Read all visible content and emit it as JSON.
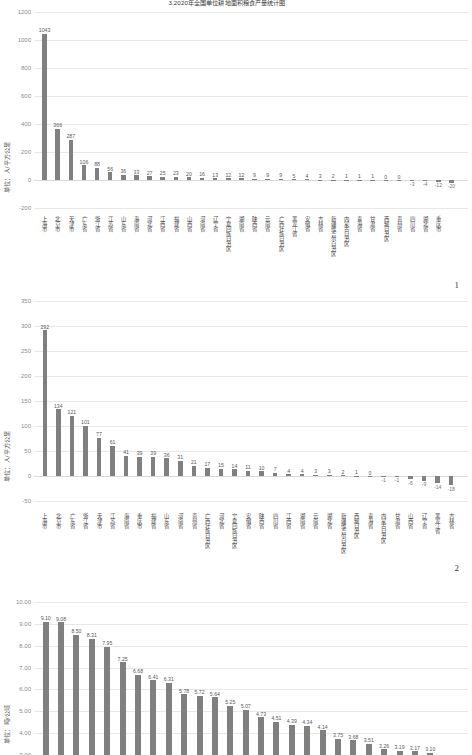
{
  "document": {
    "title": "3.2020年全国单位耕地面积粮食产量统计图"
  },
  "page_numbers": {
    "chart1": "1",
    "chart2": "2"
  },
  "charts": [
    {
      "id": "chart1",
      "ylabel": "单位：人/平方公里",
      "yticks": [
        "1200",
        "1000",
        "800",
        "600",
        "400",
        "200",
        "0",
        "-200"
      ],
      "ymin": -200,
      "ymax": 1200,
      "categories": [
        "上海市",
        "北京市",
        "天津市",
        "广东省",
        "浙江省",
        "江苏省",
        "山东省",
        "海南省",
        "河北省",
        "江西省",
        "福建省",
        "山西省",
        "河南省",
        "辽宁省",
        "宁夏回族自治区",
        "湖南省",
        "陕西省",
        "云南省",
        "广西壮族自治区",
        "黑龙江省",
        "安徽省",
        "吉林省",
        "新疆维吾尔自治区",
        "内蒙古自治区",
        "青海省",
        "甘肃省",
        "西藏自治区",
        "贵州省",
        "四川省",
        "湖北省",
        "重庆市"
      ],
      "values": [
        1043,
        366,
        287,
        106,
        88,
        56,
        36,
        33,
        27,
        25,
        23,
        20,
        16,
        13,
        12,
        12,
        9,
        9,
        9,
        5,
        4,
        3,
        2,
        1,
        1,
        1,
        0,
        0,
        -3,
        -4,
        -12,
        -20
      ]
    },
    {
      "id": "chart2",
      "ylabel": "单位：人/平方公里",
      "yticks": [
        "350",
        "300",
        "250",
        "200",
        "150",
        "100",
        "50",
        "0",
        "-50"
      ],
      "ymin": -50,
      "ymax": 350,
      "categories": [
        "上海市",
        "北京市",
        "广东省",
        "浙江省",
        "天津市",
        "江苏省",
        "海南省",
        "重庆市",
        "福建省",
        "山东省",
        "河南省",
        "贵州省",
        "广西壮族自治区",
        "河北省",
        "宁夏回族自治区",
        "安徽省",
        "陕西省",
        "四川省",
        "江西省",
        "湖南省",
        "云南省",
        "湖北省",
        "新疆维吾尔自治区",
        "西藏自治区",
        "青海省",
        "内蒙古自治区",
        "甘肃省",
        "山西省",
        "辽宁省",
        "黑龙江省",
        "吉林省"
      ],
      "values": [
        292,
        134,
        121,
        101,
        77,
        61,
        41,
        39,
        39,
        36,
        31,
        21,
        17,
        15,
        14,
        11,
        10,
        7,
        4,
        4,
        3,
        3,
        2,
        1,
        0,
        -1,
        -1,
        -6,
        -9,
        -14,
        -18
      ]
    },
    {
      "id": "chart3",
      "ylabel": "单位：吨/公顷",
      "yticks": [
        "10.00",
        "9.00",
        "8.00",
        "7.00",
        "6.00",
        "5.00",
        "4.00",
        "3.00"
      ],
      "ymin": 3.0,
      "ymax": 10.0,
      "categories": [],
      "values": [
        9.1,
        9.08,
        8.5,
        8.31,
        7.95,
        7.25,
        6.68,
        6.41,
        6.31,
        5.78,
        5.72,
        5.64,
        5.25,
        5.07,
        4.73,
        4.51,
        4.39,
        4.34,
        4.14,
        3.75,
        3.68,
        3.51,
        3.26,
        3.19,
        3.17,
        3.1
      ],
      "value_labels": [
        "9.10",
        "9.08",
        "8.50",
        "8.31",
        "7.95",
        "7.25",
        "6.68",
        "6.41",
        "6.31",
        "5.78",
        "5.72",
        "5.64",
        "5.25",
        "5.07",
        "4.73",
        "4.51",
        "4.39",
        "4.34",
        "4.14",
        "3.75",
        "3.68",
        "3.51",
        "3.26",
        "3.19",
        "3.17",
        "3.10"
      ]
    }
  ],
  "colors": {
    "bar": "#808080",
    "grid": "#e8e8e8",
    "text": "#404040",
    "tick": "#8c8c8c"
  }
}
